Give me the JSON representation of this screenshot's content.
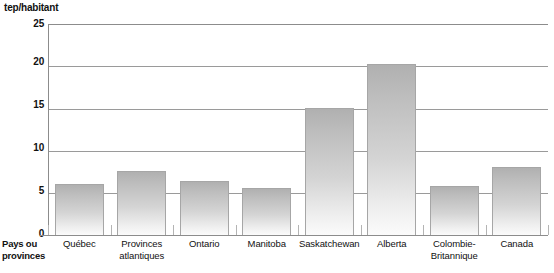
{
  "chart_data": {
    "type": "bar",
    "title": "",
    "ylabel": "tep/habitant",
    "xlabel": "Pays ou provinces",
    "ylim": [
      0,
      25
    ],
    "yticks": [
      0,
      5,
      10,
      15,
      20,
      25
    ],
    "grid": true,
    "legend": false,
    "categories": [
      "Québec",
      "Provinces atlantiques",
      "Ontario",
      "Manitoba",
      "Saskatchewan",
      "Alberta",
      "Colombie-Britannique",
      "Canada"
    ],
    "category_lines": [
      [
        "Québec",
        ""
      ],
      [
        "Provinces",
        "atlantiques"
      ],
      [
        "Ontario",
        ""
      ],
      [
        "Manitoba",
        ""
      ],
      [
        "Saskatchewan",
        ""
      ],
      [
        "Alberta",
        ""
      ],
      [
        "Colombie-",
        "Britannique"
      ],
      [
        "Canada",
        ""
      ]
    ],
    "values": [
      6.0,
      7.6,
      6.4,
      5.6,
      15.0,
      20.3,
      5.8,
      8.0
    ]
  },
  "axis": {
    "unit_label": "tep/habitant",
    "x_title_line1": "Pays ou",
    "x_title_line2": "provinces",
    "tick_labels": [
      "25",
      "20",
      "15",
      "10",
      "5",
      "0"
    ]
  },
  "colors": {
    "bar_top": "#b0b0b0",
    "bar_bottom": "#fbfbfb",
    "bar_border": "#a6a6a6",
    "grid": "#9a9a9a",
    "axis": "#8c8c8c",
    "text": "#111111",
    "background": "#ffffff"
  }
}
